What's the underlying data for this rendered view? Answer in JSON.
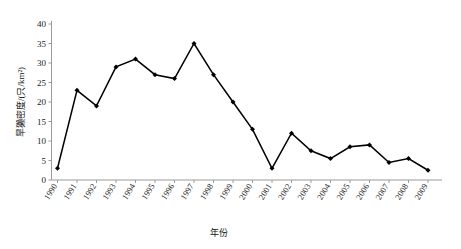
{
  "chart_data": {
    "type": "line",
    "title": "",
    "xlabel": "年份",
    "ylabel": "旱獭密度/(只/km²)",
    "categories": [
      "1990",
      "1991",
      "1992",
      "1993",
      "1994",
      "1995",
      "1996",
      "1997",
      "1998",
      "1999",
      "2000",
      "2001",
      "2002",
      "2003",
      "2004",
      "2005",
      "2006",
      "2007",
      "2008",
      "2009"
    ],
    "values": [
      3,
      23,
      19,
      29,
      31,
      27,
      26,
      35,
      27,
      20,
      13,
      3,
      12,
      7.5,
      5.5,
      8.5,
      9,
      4.5,
      5.5,
      2.5
    ],
    "series": [
      {
        "name": "旱獭密度",
        "values": [
          3,
          23,
          19,
          29,
          31,
          27,
          26,
          35,
          27,
          20,
          13,
          3,
          12,
          7.5,
          5.5,
          8.5,
          9,
          4.5,
          5.5,
          2.5
        ]
      }
    ],
    "ylim": [
      0,
      40
    ],
    "yticks": [
      0,
      5,
      10,
      15,
      20,
      25,
      30,
      35,
      40
    ],
    "ytick_labels": [
      "0",
      "5",
      "10",
      "15",
      "20",
      "25",
      "30",
      "35",
      "40"
    ],
    "grid": false,
    "legend": "none",
    "marker": "filled-diamond",
    "line_color": "#000000",
    "marker_color": "#000000",
    "axis_color": "#9a9a9a",
    "background": "#ffffff"
  }
}
